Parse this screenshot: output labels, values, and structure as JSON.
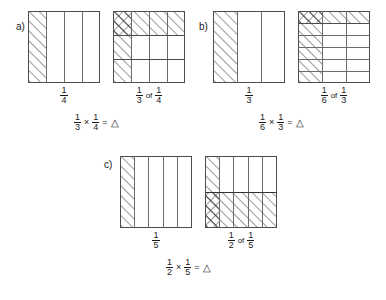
{
  "page": {
    "background": "#ffffff",
    "ink": "#1a1a1a"
  },
  "symbols": {
    "times": "×",
    "equals": "=",
    "triangle": "△",
    "of": "of"
  },
  "panels": [
    {
      "id": "a",
      "label": "a)",
      "left_model": {
        "columns": 4,
        "rows": 1,
        "shaded_columns": [
          1
        ],
        "shaded_rows": [],
        "caption_numerator": "1",
        "caption_denominator": "4"
      },
      "right_model": {
        "columns": 4,
        "rows": 3,
        "shaded_columns": [
          1
        ],
        "shaded_rows": [
          1
        ],
        "shaded_row_position": "top",
        "caption_first_numerator": "1",
        "caption_first_denominator": "3",
        "caption_second_numerator": "1",
        "caption_second_denominator": "4"
      },
      "equation": {
        "a_numerator": "1",
        "a_denominator": "3",
        "b_numerator": "1",
        "b_denominator": "4",
        "result": "△"
      }
    },
    {
      "id": "b",
      "label": "b)",
      "left_model": {
        "columns": 3,
        "rows": 1,
        "shaded_columns": [
          1
        ],
        "shaded_rows": [],
        "caption_numerator": "1",
        "caption_denominator": "3"
      },
      "right_model": {
        "columns": 3,
        "rows": 6,
        "shaded_columns": [
          1
        ],
        "shaded_rows": [
          1
        ],
        "shaded_row_position": "top",
        "caption_first_numerator": "1",
        "caption_first_denominator": "6",
        "caption_second_numerator": "1",
        "caption_second_denominator": "3"
      },
      "equation": {
        "a_numerator": "1",
        "a_denominator": "6",
        "b_numerator": "1",
        "b_denominator": "3",
        "result": "△"
      }
    },
    {
      "id": "c",
      "label": "c)",
      "left_model": {
        "columns": 5,
        "rows": 1,
        "shaded_columns": [
          1
        ],
        "shaded_rows": [],
        "caption_numerator": "1",
        "caption_denominator": "5"
      },
      "right_model": {
        "columns": 5,
        "rows": 2,
        "shaded_columns": [
          1
        ],
        "shaded_rows": [
          2
        ],
        "shaded_row_position": "bottom",
        "caption_first_numerator": "1",
        "caption_first_denominator": "2",
        "caption_second_numerator": "1",
        "caption_second_denominator": "5"
      },
      "equation": {
        "a_numerator": "1",
        "a_denominator": "2",
        "b_numerator": "1",
        "b_denominator": "5",
        "result": "△"
      }
    }
  ]
}
